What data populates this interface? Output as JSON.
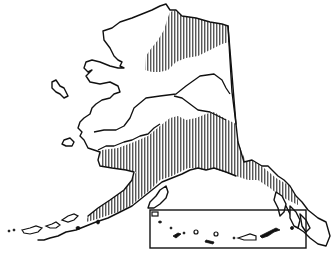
{
  "map": {
    "subject": "Alaska",
    "style": "black-and-white line art",
    "colors": {
      "ink": "#111111",
      "background": "#ffffff"
    },
    "layers": [
      {
        "id": "coastline",
        "type": "outline"
      },
      {
        "id": "canada-border",
        "type": "boundary-line"
      },
      {
        "id": "northern-hatched-region",
        "type": "vertical-hatch",
        "location": "north slope / Brooks Range"
      },
      {
        "id": "southern-hatched-region",
        "type": "vertical-hatch",
        "location": "south-central coast, Alaska Peninsula, panhandle"
      },
      {
        "id": "interior-rivers",
        "type": "line"
      },
      {
        "id": "aleutian-inset",
        "type": "inset-box",
        "location": "bottom right"
      }
    ],
    "labels": []
  }
}
